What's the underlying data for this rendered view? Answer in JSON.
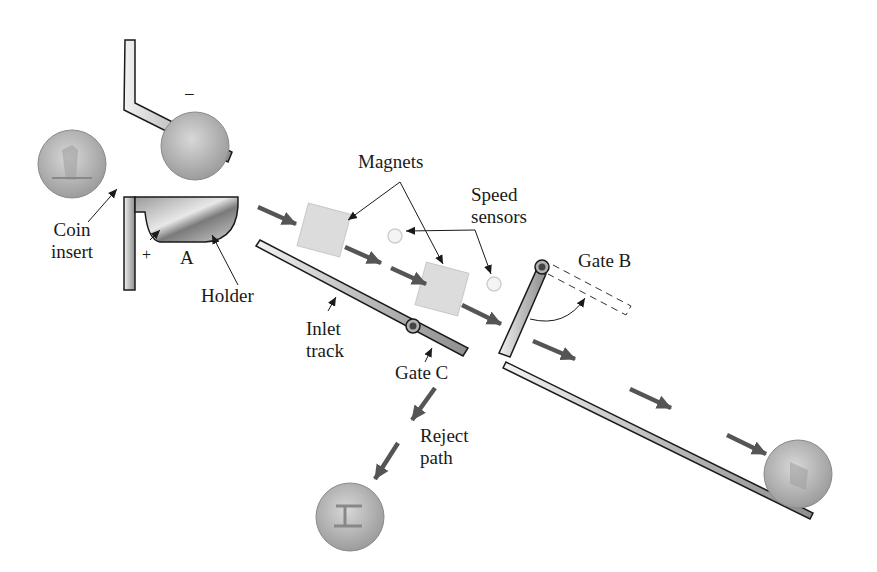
{
  "diagram": {
    "labels": {
      "coin_insert": [
        "Coin",
        "insert"
      ],
      "holder": "Holder",
      "point_a": "A",
      "plus_sign": "+",
      "minus_sign": "−",
      "magnets": "Magnets",
      "speed_sensors": [
        "Speed",
        "sensors"
      ],
      "gate_b": "Gate B",
      "inlet_track": [
        "Inlet",
        "track"
      ],
      "gate_c": "Gate C",
      "reject_path": [
        "Reject",
        "path"
      ]
    },
    "colors": {
      "track_fill": "#c8c8c8",
      "outline": "#1a1a1a",
      "arrow": "#555555",
      "magnet": "#dcdcdc",
      "coin": "#b8b8b8",
      "sensor": "#f4f4f4"
    }
  }
}
